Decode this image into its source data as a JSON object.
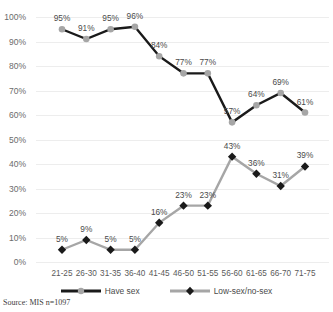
{
  "chart_data": {
    "type": "line",
    "title": "",
    "xlabel": "",
    "ylabel": "",
    "ylim": [
      0,
      100
    ],
    "ytick_labels": [
      "100%",
      "90%",
      "80%",
      "70%",
      "60%",
      "50%",
      "40%",
      "30%",
      "20%",
      "10%",
      "0%"
    ],
    "yticks": [
      100,
      90,
      80,
      70,
      60,
      50,
      40,
      30,
      20,
      10,
      0
    ],
    "grid": true,
    "legend_position": "bottom",
    "categories": [
      "21-25",
      "26-30",
      "31-35",
      "36-40",
      "41-45",
      "46-50",
      "51-55",
      "56-60",
      "61-65",
      "66-70",
      "71-75"
    ],
    "series": [
      {
        "name": "Have sex",
        "values": [
          95,
          91,
          95,
          96,
          84,
          77,
          77,
          57,
          64,
          69,
          61
        ],
        "labels": [
          "95%",
          "91%",
          "95%",
          "96%",
          "84%",
          "77%",
          "77%",
          "57%",
          "64%",
          "69%",
          "61%"
        ],
        "line_color": "#1a1a1a",
        "marker_color": "#a6a6a6",
        "marker": "circle"
      },
      {
        "name": "Low-sex/no-sex",
        "values": [
          5,
          9,
          5,
          5,
          16,
          23,
          23,
          43,
          36,
          31,
          39
        ],
        "labels": [
          "5%",
          "9%",
          "5%",
          "5%",
          "16%",
          "23%",
          "23%",
          "43%",
          "36%",
          "31%",
          "39%"
        ],
        "line_color": "#a6a6a6",
        "marker_color": "#1a1a1a",
        "marker": "diamond"
      }
    ]
  },
  "legend": {
    "items": [
      {
        "label": "Have sex"
      },
      {
        "label": "Low-sex/no-sex"
      }
    ]
  },
  "footer": {
    "source": "Source: MIS n=1097"
  }
}
